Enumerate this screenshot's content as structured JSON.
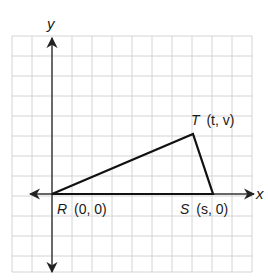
{
  "diagram": {
    "type": "coordinate-plane-triangle",
    "axes": {
      "x_label": "x",
      "y_label": "y"
    },
    "points": [
      {
        "name": "R",
        "coords": "(0, 0)"
      },
      {
        "name": "S",
        "coords": "(s, 0)"
      },
      {
        "name": "T",
        "coords": "(t, v)"
      }
    ],
    "colors": {
      "grid": "#d4d4d4",
      "axis": "#333333",
      "triangle": "#111111"
    }
  }
}
